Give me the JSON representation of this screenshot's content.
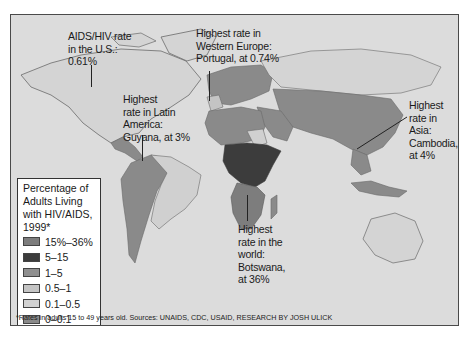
{
  "title": "Percentage of Adults Living with HIV/AIDS, 1999*",
  "legend": {
    "title_lines": [
      "Percentage of",
      "Adults Living",
      "with HIV/AIDS,",
      "1999*"
    ],
    "items": [
      {
        "label": "15%–36%",
        "color": "#7d7d7d"
      },
      {
        "label": "5–15",
        "color": "#3c3c3c"
      },
      {
        "label": "1–5",
        "color": "#8f8f8f"
      },
      {
        "label": "0.5–1",
        "color": "#c4c4c4"
      },
      {
        "label": "0.1–0.5",
        "color": "#d2d2d2"
      },
      {
        "label": "0–0.1",
        "color": "#8a8a8a"
      },
      {
        "label": "No data",
        "color": "#ffffff"
      }
    ]
  },
  "annotations": {
    "us": {
      "lines": [
        "AIDS/HIV rate",
        "in the U.S.:",
        "0.61%"
      ]
    },
    "western_europe": {
      "lines": [
        "Highest rate in",
        "Western Europe:",
        "Portugal, at 0.74%"
      ]
    },
    "latin_america": {
      "lines": [
        "Highest",
        "rate in Latin",
        "America:",
        "Guyana, at 3%"
      ]
    },
    "asia": {
      "lines": [
        "Highest",
        "rate in Asia:",
        "Cambodia,",
        "at 4%"
      ]
    },
    "world": {
      "lines": [
        "Highest",
        "rate in the",
        "world:",
        "Botswana,",
        "at 36%"
      ]
    }
  },
  "footnote": "*Rates in adults 15 to 49 years old. Sources: UNAIDS, CDC, USAID, RESEARCH BY JOSH ULICK",
  "colors": {
    "ocean": "#dcdcdc",
    "land_low": "#8a8a8a",
    "land_light": "#d0d0d0",
    "land_dark": "#3c3c3c",
    "outline": "#6a6a6a"
  }
}
